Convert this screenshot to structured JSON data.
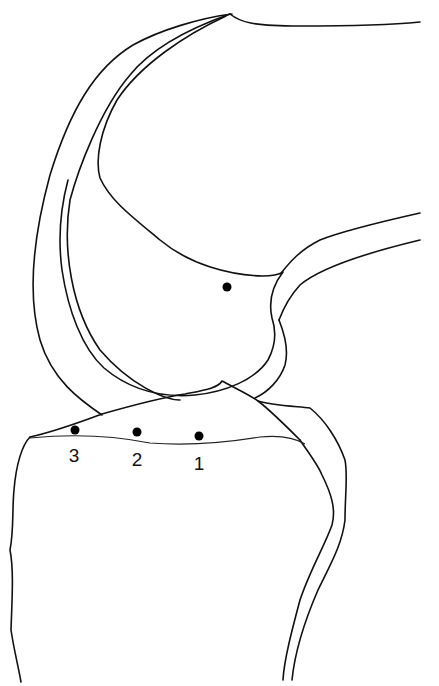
{
  "diagram": {
    "stroke_color": "#111111",
    "background": "#ffffff",
    "femoral_marker": {
      "x": 227,
      "y": 287
    },
    "tibial_markers": [
      {
        "label": "3",
        "x": 75,
        "y": 430,
        "label_x": 74,
        "label_y": 446
      },
      {
        "label": "2",
        "x": 137,
        "y": 432,
        "label_x": 137,
        "label_y": 450
      },
      {
        "label": "1",
        "x": 199,
        "y": 436,
        "label_x": 199,
        "label_y": 454
      }
    ]
  }
}
